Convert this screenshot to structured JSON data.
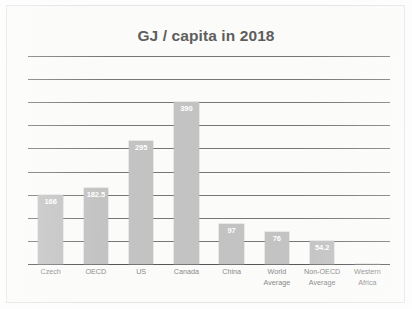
{
  "chart": {
    "title": "GJ / capita in 2018"
  },
  "chart_data": {
    "type": "bar",
    "title": "GJ / capita in 2018",
    "xlabel": "",
    "ylabel": "",
    "ylim": [
      0,
      500
    ],
    "grid": true,
    "gridlines": 10,
    "grid_step": 50,
    "axis_tick_labels": [],
    "legend": null,
    "legend_position": "none",
    "bar_color": "#c3c3c3",
    "data_label_color": "#ffffff",
    "categories": [
      "Czech",
      "OECD",
      "US",
      "Canada",
      "China",
      "World\nAverage",
      "Non-OECD\nAverage",
      "Western\nAfrica"
    ],
    "category_labels_flat": [
      "Czech",
      "OECD",
      "US",
      "Canada",
      "China",
      "World Average",
      "Non-OECD Average",
      "Western Africa"
    ],
    "values": [
      166,
      182.5,
      295,
      390,
      97,
      76,
      54.2,
      0
    ],
    "value_labels": [
      "166",
      "182.5",
      "295",
      "390",
      "97",
      "76",
      "54.2",
      ""
    ]
  }
}
